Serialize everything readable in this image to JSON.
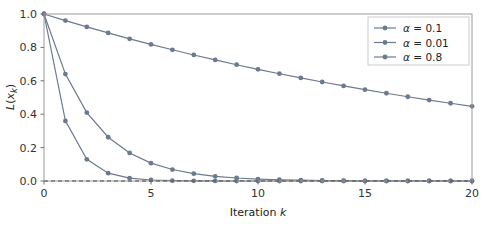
{
  "chart_data": {
    "type": "line",
    "title": "",
    "xlabel": "Iteration k",
    "ylabel": "L(xₖ)",
    "xlim": [
      0,
      20
    ],
    "ylim": [
      0.0,
      1.0
    ],
    "grid": false,
    "legend_position": "upper right",
    "xticks": [
      "0",
      "5",
      "10",
      "15",
      "20"
    ],
    "xtick_values": [
      0,
      5,
      10,
      15,
      20
    ],
    "yticks": [
      "0.0",
      "0.2",
      "0.4",
      "0.6",
      "0.8",
      "1.0"
    ],
    "ytick_values": [
      0.0,
      0.2,
      0.4,
      0.6,
      0.8,
      1.0
    ],
    "x": [
      0,
      1,
      2,
      3,
      4,
      5,
      6,
      7,
      8,
      9,
      10,
      11,
      12,
      13,
      14,
      15,
      16,
      17,
      18,
      19,
      20
    ],
    "series": [
      {
        "name": "α = 0.1",
        "color": "#6b7a8f",
        "marker": "circle",
        "values": [
          1.0,
          0.64,
          0.41,
          0.262,
          0.168,
          0.107,
          0.0687,
          0.044,
          0.0281,
          0.018,
          0.0115,
          0.00738,
          0.00472,
          0.00302,
          0.00193,
          0.00124,
          0.00079,
          0.00051,
          0.00032,
          0.00021,
          0.00013
        ]
      },
      {
        "name": "α = 0.01",
        "color": "#6b7a8f",
        "marker": "circle",
        "values": [
          1.0,
          0.9606,
          0.9227,
          0.8865,
          0.8515,
          0.8179,
          0.7857,
          0.7547,
          0.7249,
          0.6963,
          0.6688,
          0.6424,
          0.6171,
          0.5927,
          0.5693,
          0.5469,
          0.5253,
          0.5046,
          0.4847,
          0.4656,
          0.4472
        ]
      },
      {
        "name": "α = 0.8",
        "color": "#6b7a8f",
        "marker": "circle",
        "values": [
          1.0,
          0.36,
          0.1296,
          0.0467,
          0.0168,
          0.00605,
          0.00218,
          0.00078,
          0.00028,
          0.0001,
          4e-05,
          1e-05,
          5e-06,
          2e-06,
          6e-07,
          2e-07,
          8e-08,
          3e-08,
          1e-08,
          4e-09,
          1e-09
        ]
      }
    ],
    "annotations": [
      {
        "name": "zero-reference-line",
        "type": "hline",
        "y": 0.0,
        "style": "dashed",
        "color": "#000000"
      }
    ]
  },
  "axes": {
    "x_label": "Iteration k",
    "x_label_main": "Iteration",
    "x_label_italic": "k",
    "y_label": "L(xₖ)"
  },
  "legend": {
    "entries": [
      {
        "label": "α = 0.1"
      },
      {
        "label": "α = 0.01"
      },
      {
        "label": "α = 0.8"
      }
    ]
  }
}
